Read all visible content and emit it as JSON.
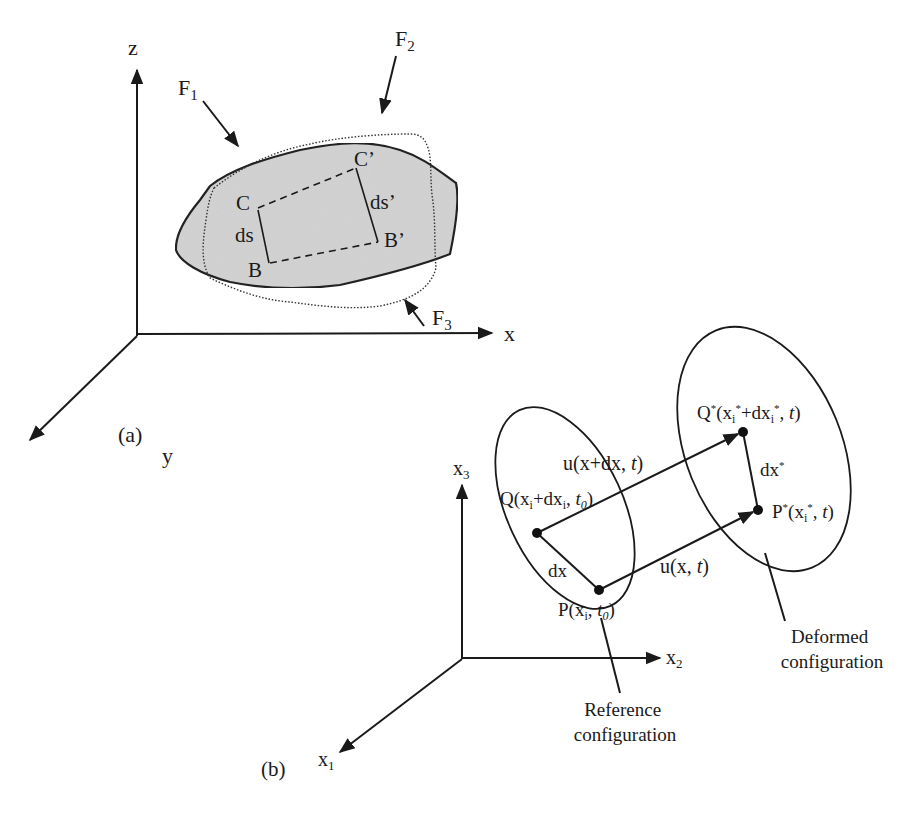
{
  "panel_a": {
    "caption": "(a)",
    "axes": {
      "z": "z",
      "x": "x",
      "y": "y"
    },
    "forces": [
      {
        "name": "F",
        "sub": "1"
      },
      {
        "name": "F",
        "sub": "2"
      },
      {
        "name": "F",
        "sub": "3"
      }
    ],
    "points": {
      "C": "C",
      "B": "B",
      "C_prime": "C’",
      "B_prime": "B’"
    },
    "segments": {
      "ds": "ds",
      "ds_prime": "ds’"
    },
    "colors": {
      "body_fill": "#d3d3d3",
      "outline": "#222222"
    }
  },
  "panel_b": {
    "caption": "(b)",
    "axes": {
      "x1": {
        "name": "x",
        "sub": "1"
      },
      "x2": {
        "name": "x",
        "sub": "2"
      },
      "x3": {
        "name": "x",
        "sub": "3"
      }
    },
    "labels": {
      "Q": {
        "a": "Q(x",
        "b": "i",
        "c": "+dx",
        "d": "i",
        "e": ", ",
        "f": "t",
        "g": "0",
        "h": ")"
      },
      "P": {
        "a": "P(x",
        "b": "i",
        "c": ", ",
        "d": "t",
        "e": "0",
        "f": ")"
      },
      "Q_star": {
        "a": "Q",
        "b": "*",
        "c": "(x",
        "d": "i",
        "e": "*",
        "f": "+dx",
        "g": "i",
        "h": "*",
        "i": ", ",
        "j": "t",
        "k": ")"
      },
      "P_star": {
        "a": "P",
        "b": "*",
        "c": "(x",
        "d": "i",
        "e": "*",
        "f": ", ",
        "g": "t",
        "h": ")"
      },
      "dx": "dx",
      "dx_star": {
        "a": "dx",
        "b": "*"
      },
      "u_x_dx": {
        "a": "u(x+dx, ",
        "b": "t",
        "c": ")"
      },
      "u_x": {
        "a": "u(x, ",
        "b": "t",
        "c": ")"
      }
    },
    "callouts": {
      "reference": [
        "Reference",
        "configuration"
      ],
      "deformed": [
        "Deformed",
        "configuration"
      ]
    }
  }
}
